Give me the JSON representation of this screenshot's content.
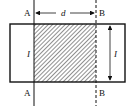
{
  "diagram": {
    "labels": {
      "top_left": "A",
      "top_right": "B",
      "bottom_left": "A",
      "bottom_right": "B",
      "distance": "d",
      "left_current": "I",
      "right_current": "I"
    },
    "colors": {
      "stroke": "#111111",
      "background": "#ffffff"
    }
  }
}
